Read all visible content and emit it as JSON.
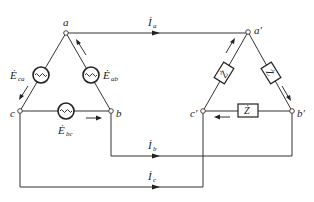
{
  "diagram": {
    "type": "three-phase delta-delta circuit",
    "source_nodes": {
      "a": "a",
      "b": "b",
      "c": "c"
    },
    "load_nodes": {
      "a": "a′",
      "b": "b′",
      "c": "c′"
    },
    "sources": [
      {
        "id": "E_ab",
        "base": "Ė",
        "sub": "ab"
      },
      {
        "id": "E_bc",
        "base": "Ė",
        "sub": "bc"
      },
      {
        "id": "E_ca",
        "base": "Ė",
        "sub": "ca"
      }
    ],
    "impedances": [
      {
        "id": "Z_ab",
        "label": "Ż"
      },
      {
        "id": "Z_bc",
        "label": "Ż"
      },
      {
        "id": "Z_ca",
        "label": "Ż"
      }
    ],
    "line_currents": [
      {
        "id": "I_a",
        "base": "İ",
        "sub": "a"
      },
      {
        "id": "I_b",
        "base": "İ",
        "sub": "b"
      },
      {
        "id": "I_c",
        "base": "İ",
        "sub": "c"
      }
    ]
  }
}
